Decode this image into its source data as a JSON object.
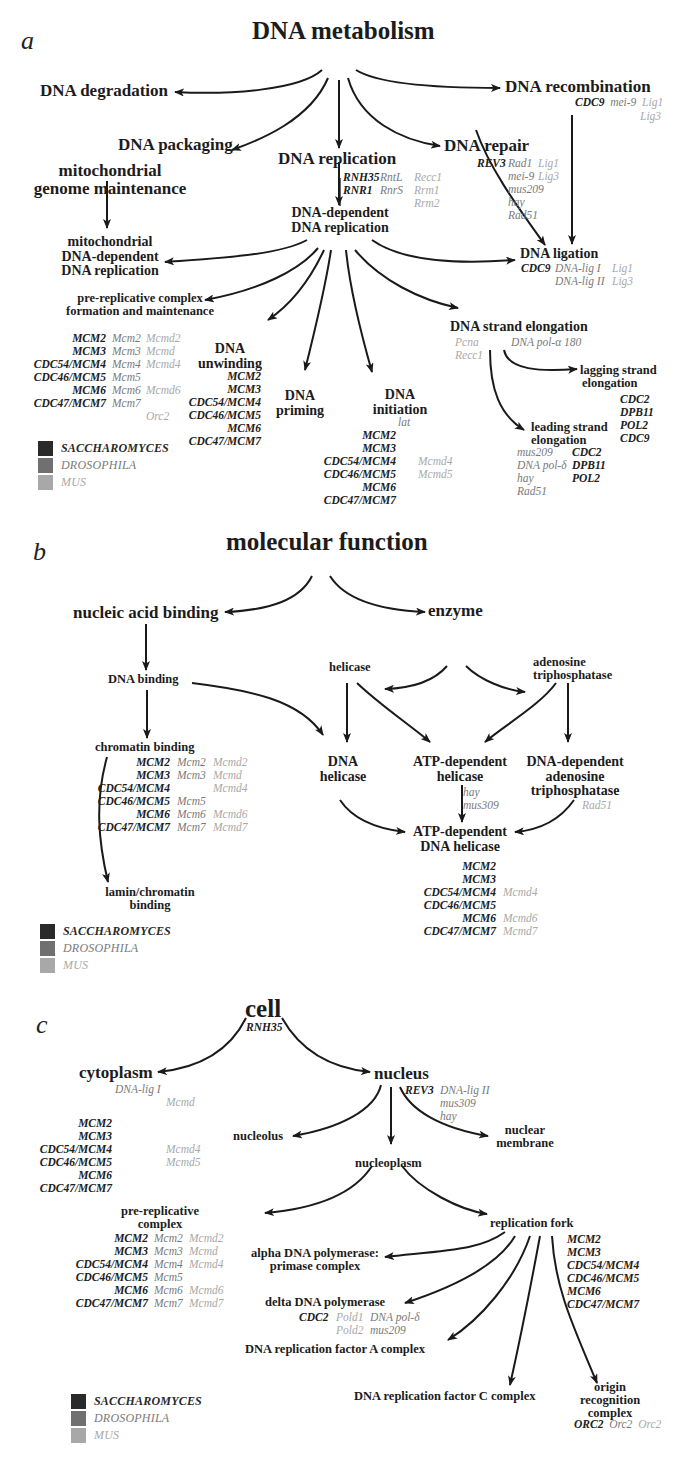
{
  "legend": {
    "items": [
      {
        "label": "SACCHAROMYCES",
        "color": "#2a2a2a"
      },
      {
        "label": "DROSOPHILA",
        "color": "#707070"
      },
      {
        "label": "MUS",
        "color": "#a8a8a8"
      }
    ]
  },
  "panel_a": {
    "letter": "a",
    "root": "DNA metabolism",
    "nodes": {
      "degradation": "DNA degradation",
      "packaging": "DNA packaging",
      "replication": "DNA replication",
      "repair": "DNA repair",
      "recombination": "DNA recombination",
      "mito_line1": "mitochondrial",
      "mito_line2": "genome maintenance",
      "dna_dep_line1": "DNA-dependent",
      "dna_dep_line2": "DNA replication",
      "mito_dep_line1": "mitochondrial",
      "mito_dep_line2": "DNA-dependent",
      "mito_dep_line3": "DNA replication",
      "ligation": "DNA ligation",
      "prerep_line1": "pre-replicative complex",
      "prerep_line2": "formation and maintenance",
      "unwinding_line1": "DNA",
      "unwinding_line2": "unwinding",
      "priming_line1": "DNA",
      "priming_line2": "priming",
      "initiation_line1": "DNA",
      "initiation_line2": "initiation",
      "strand_elong": "DNA strand elongation",
      "lagging_line1": "lagging strand",
      "lagging_line2": "elongation",
      "leading_line1": "leading strand",
      "leading_line2": "elongation"
    },
    "genes": {
      "recombination": {
        "sac": [
          "CDC9"
        ],
        "dro": [
          "mei-9"
        ],
        "mus": [
          "Lig1",
          "Lig3"
        ]
      },
      "replication": {
        "sac": [
          "RNH35",
          "RNR1"
        ],
        "dro": [
          "RntL",
          "RnrS"
        ],
        "mus": [
          "Recc1",
          "Rrm1",
          "Rrm2"
        ]
      },
      "repair": {
        "sac": [
          "REV3"
        ],
        "dro": [
          "Rad1",
          "mei-9",
          "mus209",
          "hay",
          "Rad51"
        ],
        "mus": [
          "Lig1",
          "Lig3"
        ]
      },
      "ligation": {
        "sac": [
          "CDC9"
        ],
        "dro": [
          "DNA-lig I",
          "DNA-lig II"
        ],
        "mus": [
          "Lig1",
          "Lig3"
        ]
      },
      "prerep": {
        "sac": [
          "MCM2",
          "MCM3",
          "CDC54/MCM4",
          "CDC46/MCM5",
          "MCM6",
          "CDC47/MCM7"
        ],
        "dro": [
          "Mcm2",
          "Mcm3",
          "Mcm4",
          "Mcm5",
          "Mcm6",
          "Mcm7"
        ],
        "mus": [
          "Mcmd2",
          "Mcmd",
          "Mcmd4",
          "",
          "Mcmd6",
          "",
          "Orc2"
        ]
      },
      "unwinding": {
        "sac": [
          "MCM2",
          "MCM3",
          "CDC54/MCM4",
          "CDC46/MCM5",
          "MCM6",
          "CDC47/MCM7"
        ]
      },
      "initiation": {
        "sac": [
          "MCM2",
          "MCM3",
          "CDC54/MCM4",
          "CDC46/MCM5",
          "MCM6",
          "CDC47/MCM7"
        ],
        "dro": [
          "lat"
        ],
        "mus": [
          "Mcmd4",
          "Mcmd5"
        ]
      },
      "strand_elong": {
        "mus": [
          "Pcna",
          "Recc1"
        ],
        "dro": [
          "DNA pol-α 180"
        ]
      },
      "lagging": {
        "sac": [
          "CDC2",
          "DPB11",
          "POL2",
          "CDC9"
        ]
      },
      "leading": {
        "dro": [
          "mus209",
          "DNA pol-δ",
          "hay",
          "Rad51"
        ],
        "sac": [
          "CDC2",
          "DPB11",
          "POL2"
        ]
      }
    }
  },
  "panel_b": {
    "letter": "b",
    "root": "molecular function",
    "nodes": {
      "nucleic": "nucleic acid binding",
      "enzyme": "enzyme",
      "dna_binding": "DNA binding",
      "helicase": "helicase",
      "atpase_line1": "adenosine",
      "atpase_line2": "triphosphatase",
      "chromatin": "chromatin binding",
      "dna_helicase_line1": "DNA",
      "dna_helicase_line2": "helicase",
      "atp_helicase_line1": "ATP-dependent",
      "atp_helicase_line2": "helicase",
      "dna_dep_atpase_line1": "DNA-dependent",
      "dna_dep_atpase_line2": "adenosine",
      "dna_dep_atpase_line3": "triphosphatase",
      "atp_dna_helicase_line1": "ATP-dependent",
      "atp_dna_helicase_line2": "DNA helicase",
      "lamin_line1": "lamin/chromatin",
      "lamin_line2": "binding"
    },
    "genes": {
      "chromatin": {
        "sac": [
          "MCM2",
          "MCM3",
          "CDC54/MCM4",
          "CDC46/MCM5",
          "MCM6",
          "CDC47/MCM7"
        ],
        "dro": [
          "Mcm2",
          "Mcm3",
          "",
          "Mcm5",
          "Mcm6",
          "Mcm7"
        ],
        "mus": [
          "Mcmd2",
          "Mcmd",
          "Mcmd4",
          "",
          "Mcmd6",
          "Mcmd7"
        ]
      },
      "atp_helicase": {
        "dro": [
          "hay",
          "mus309"
        ]
      },
      "dna_dep_atpase": {
        "mus": [
          "Rad51"
        ]
      },
      "atp_dna_helicase": {
        "sac": [
          "MCM2",
          "MCM3",
          "CDC54/MCM4",
          "CDC46/MCM5",
          "MCM6",
          "CDC47/MCM7"
        ],
        "mus": [
          "",
          "",
          "Mcmd4",
          "",
          "Mcmd6",
          "Mcmd7"
        ]
      }
    }
  },
  "panel_c": {
    "letter": "c",
    "root": "cell",
    "nodes": {
      "cytoplasm": "cytoplasm",
      "nucleus": "nucleus",
      "nucleolus": "nucleolus",
      "nucleoplasm": "nucleoplasm",
      "membrane_line1": "nuclear",
      "membrane_line2": "membrane",
      "prerep_line1": "pre-replicative",
      "prerep_line2": "complex",
      "fork": "replication fork",
      "alpha_line1": "alpha DNA polymerase:",
      "alpha_line2": "primase complex",
      "delta": "delta DNA polymerase",
      "rfa": "DNA replication factor A complex",
      "rfc": "DNA replication factor C complex",
      "orc_line1": "origin",
      "orc_line2": "recognition",
      "orc_line3": "complex"
    },
    "genes": {
      "cell": {
        "sac": [
          "RNH35"
        ]
      },
      "cytoplasm": {
        "dro": [
          "DNA-lig I"
        ],
        "mus": [
          "Mcmd",
          "Mcmd4",
          "Mcmd5"
        ],
        "sac": [
          "MCM2",
          "MCM3",
          "CDC54/MCM4",
          "CDC46/MCM5",
          "MCM6",
          "CDC47/MCM7"
        ]
      },
      "nucleus": {
        "sac": [
          "REV3"
        ],
        "dro": [
          "DNA-lig II",
          "mus309",
          "hay"
        ]
      },
      "prerep": {
        "sac": [
          "MCM2",
          "MCM3",
          "CDC54/MCM4",
          "CDC46/MCM5",
          "MCM6",
          "CDC47/MCM7"
        ],
        "dro": [
          "Mcm2",
          "Mcm3",
          "Mcm4",
          "Mcm5",
          "Mcm6",
          "Mcm7"
        ],
        "mus": [
          "Mcmd2",
          "Mcmd",
          "Mcmd4",
          "",
          "Mcmd6",
          "Mcmd7"
        ]
      },
      "fork": {
        "sac": [
          "MCM2",
          "MCM3",
          "CDC54/MCM4",
          "CDC46/MCM5",
          "MCM6",
          "CDC47/MCM7"
        ]
      },
      "delta": {
        "sac": [
          "CDC2"
        ],
        "mus": [
          "Pold1",
          "Pold2"
        ],
        "dro": [
          "DNA pol-δ",
          "mus209"
        ]
      },
      "orc": {
        "sac": [
          "ORC2"
        ],
        "dro": [
          "Orc2"
        ],
        "mus": [
          "Orc2"
        ]
      }
    }
  }
}
